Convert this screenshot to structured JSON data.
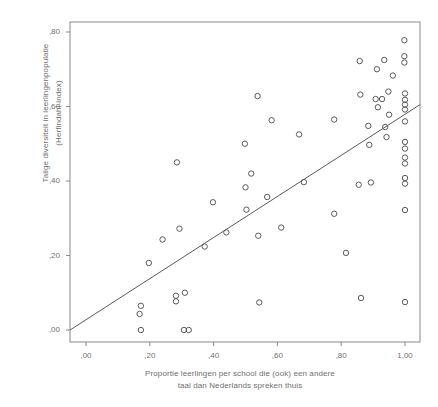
{
  "chart_data": {
    "type": "scatter",
    "title": "",
    "xlabel": "Proportie leerlingen per school die (ook) een andere taal dan Nederlands spreken thuis",
    "xlabel_line1": "Proportie leerlingen per school die (ook) een andere",
    "xlabel_line2": "taal dan Nederlands spreken thuis",
    "ylabel": "Talige diversiteit in leerlingenpopulatie (Herfindahl-index)",
    "ylabel_line1": "Talige diversiteit in leerlingenpopulatie",
    "ylabel_line2": "(Herfindahl-index)",
    "xlim": [
      -0.05,
      1.05
    ],
    "ylim": [
      -0.035,
      0.835
    ],
    "grid": false,
    "legend": null,
    "xticks": [
      0.0,
      0.2,
      0.4,
      0.6,
      0.8,
      1.0
    ],
    "xtick_labels": [
      ",00",
      ",20",
      ",40",
      ",60",
      ",80",
      "1,00"
    ],
    "yticks": [
      0.0,
      0.2,
      0.4,
      0.6,
      0.8
    ],
    "ytick_labels": [
      ",00",
      ",20",
      ",40",
      ",60",
      ",80"
    ],
    "marker": "open-circle",
    "marker_color": "#5a5a5a",
    "axis_color": "#8a8a8a",
    "fit_line": {
      "type": "linear-regression",
      "x_start": -0.05,
      "y_start": 0.0,
      "x_end": 1.047,
      "y_end": 0.605,
      "color": "#5a5a5a"
    },
    "points": [
      [
        0.172,
        0.0
      ],
      [
        0.168,
        0.043
      ],
      [
        0.172,
        0.065
      ],
      [
        0.197,
        0.18
      ],
      [
        0.24,
        0.243
      ],
      [
        0.282,
        0.092
      ],
      [
        0.282,
        0.077
      ],
      [
        0.285,
        0.45
      ],
      [
        0.293,
        0.272
      ],
      [
        0.307,
        0.0
      ],
      [
        0.322,
        0.0
      ],
      [
        0.31,
        0.1
      ],
      [
        0.372,
        0.224
      ],
      [
        0.398,
        0.343
      ],
      [
        0.44,
        0.262
      ],
      [
        0.498,
        0.5
      ],
      [
        0.5,
        0.383
      ],
      [
        0.503,
        0.323
      ],
      [
        0.518,
        0.42
      ],
      [
        0.538,
        0.628
      ],
      [
        0.54,
        0.253
      ],
      [
        0.543,
        0.074
      ],
      [
        0.568,
        0.357
      ],
      [
        0.582,
        0.563
      ],
      [
        0.612,
        0.275
      ],
      [
        0.668,
        0.525
      ],
      [
        0.683,
        0.397
      ],
      [
        0.778,
        0.565
      ],
      [
        0.778,
        0.312
      ],
      [
        0.815,
        0.207
      ],
      [
        0.855,
        0.39
      ],
      [
        0.858,
        0.722
      ],
      [
        0.86,
        0.632
      ],
      [
        0.862,
        0.086
      ],
      [
        0.885,
        0.548
      ],
      [
        0.888,
        0.497
      ],
      [
        0.893,
        0.396
      ],
      [
        0.908,
        0.62
      ],
      [
        0.912,
        0.7
      ],
      [
        0.915,
        0.598
      ],
      [
        0.928,
        0.62
      ],
      [
        0.935,
        0.725
      ],
      [
        0.938,
        0.545
      ],
      [
        0.942,
        0.518
      ],
      [
        0.948,
        0.64
      ],
      [
        0.95,
        0.578
      ],
      [
        0.962,
        0.683
      ],
      [
        0.998,
        0.778
      ],
      [
        0.998,
        0.735
      ],
      [
        0.998,
        0.718
      ],
      [
        1.0,
        0.635
      ],
      [
        1.0,
        0.618
      ],
      [
        1.0,
        0.605
      ],
      [
        1.0,
        0.592
      ],
      [
        1.0,
        0.56
      ],
      [
        1.0,
        0.505
      ],
      [
        1.0,
        0.487
      ],
      [
        1.0,
        0.463
      ],
      [
        1.0,
        0.447
      ],
      [
        1.0,
        0.408
      ],
      [
        1.0,
        0.393
      ],
      [
        1.0,
        0.322
      ],
      [
        1.0,
        0.075
      ]
    ]
  }
}
